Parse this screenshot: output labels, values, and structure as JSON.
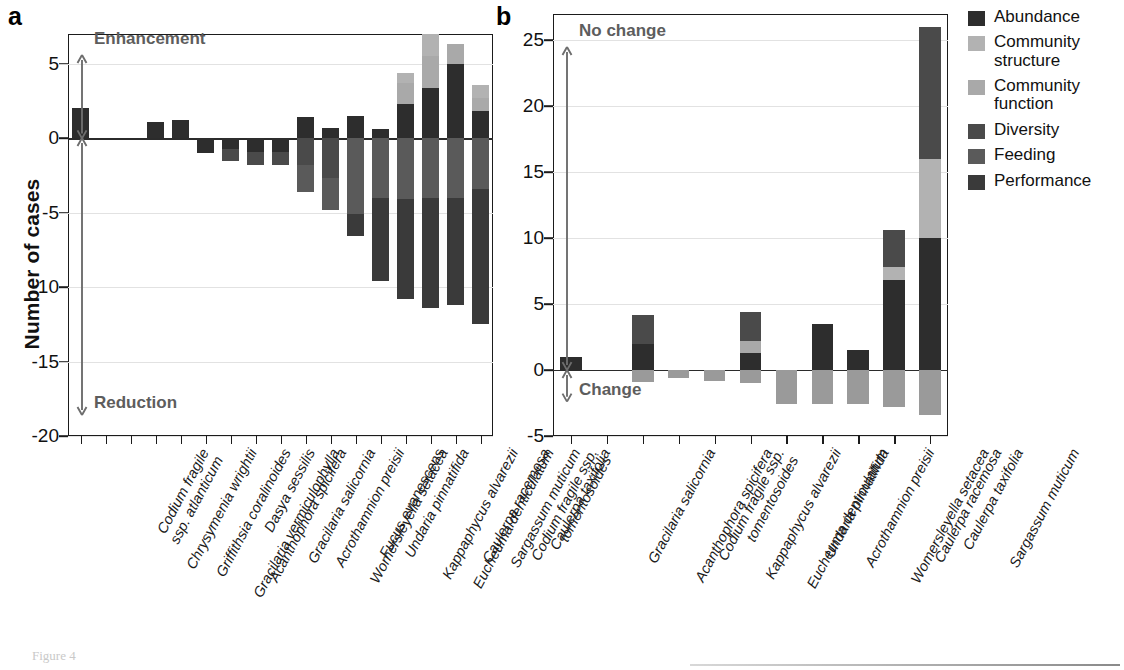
{
  "figure": {
    "caption": "Figure 4",
    "y_axis_title": "Number of cases",
    "panel_a_letter": "a",
    "panel_b_letter": "b"
  },
  "legend": {
    "position": "right",
    "items": [
      {
        "label": "Abundance",
        "color": "#2d2d2d"
      },
      {
        "label": "Community structure",
        "color": "#b2b2b2"
      },
      {
        "label": "Community function",
        "color": "#a9a9a9"
      },
      {
        "label": "Diversity",
        "color": "#4a4a4a"
      },
      {
        "label": "Feeding",
        "color": "#5a5a5a"
      },
      {
        "label": "Performance",
        "color": "#3a3a3a"
      }
    ]
  },
  "chart_data": [
    {
      "id": "panel-a",
      "type": "bar",
      "stacked": true,
      "title": "a",
      "xlabel": "",
      "ylabel": "Number of cases",
      "ylim": [
        -20,
        7
      ],
      "yticks": [
        5,
        0,
        -5,
        -10,
        -15,
        -20
      ],
      "ytick_labels": [
        "5",
        "0",
        "-5",
        "-10",
        "-15",
        "-20"
      ],
      "grid": true,
      "annotations": [
        {
          "text": "Enhancement",
          "range": [
            0,
            5.6
          ]
        },
        {
          "text": "Reduction",
          "range": [
            -18.6,
            0
          ]
        }
      ],
      "categories": [
        "Codium fragile ssp. atlanticum",
        "Chrysymenia wrightii",
        "Griffithsia coralinoides",
        "Gracilaria vermiculophylla",
        "Acanthophora spicifera",
        "Dasya sessilis",
        "Gracilaria salicornia",
        "Acrothamnion preisii",
        "Womersleyella setacea",
        "Fucus evanescens",
        "Undaria pinnatifida",
        "Kappaphycus alvarezii",
        "Eucheuma denticulatum",
        "Caulerpa racemosa",
        "Sargassum muticum",
        "Codium fragile ssp. tomentosoides",
        "Caulerpa taxifolia"
      ],
      "category_lines": [
        [
          "Codium fragile",
          "ssp. atlanticum"
        ],
        [
          "Chrysymenia wrightii"
        ],
        [
          "Griffithsia coralinoides"
        ],
        [
          "Gracilaria vermiculophylla"
        ],
        [
          "Acanthophora spicifera"
        ],
        [
          "Dasya sessilis"
        ],
        [
          "Gracilaria salicornia"
        ],
        [
          "Acrothamnion preisii"
        ],
        [
          "Womersleyella setacea"
        ],
        [
          "Fucus evanescens"
        ],
        [
          "Undaria pinnatifida"
        ],
        [
          "Kappaphycus alvarezii"
        ],
        [
          "Eucheuma denticulatum"
        ],
        [
          "Caulerpa racemosa"
        ],
        [
          "Sargassum muticum"
        ],
        [
          "Codium fragile ssp.",
          "tomentosoides"
        ],
        [
          "Caulerpa taxifolia"
        ]
      ],
      "series": [
        {
          "name": "Abundance",
          "color": "#2d2d2d",
          "values": [
            2.0,
            0,
            0,
            1.1,
            1.2,
            -1.0,
            -0.7,
            -0.9,
            -0.9,
            1.4,
            0.7,
            1.5,
            0.6,
            2.3,
            3.4,
            5.0,
            1.8
          ]
        },
        {
          "name": "Community structure",
          "color": "#b2b2b2",
          "values": [
            0,
            0,
            0,
            0,
            0,
            0,
            0,
            0,
            0,
            0,
            0,
            0,
            0,
            0.7,
            1.5,
            0,
            0.9
          ]
        },
        {
          "name": "Community function",
          "color": "#a9a9a9",
          "values": [
            0,
            0,
            0,
            0,
            0,
            0,
            0,
            0,
            0,
            0,
            0,
            0,
            0,
            1.4,
            2.1,
            1.3,
            0.9
          ]
        },
        {
          "name": "Diversity",
          "color": "#4a4a4a",
          "values": [
            0,
            0,
            0,
            0,
            0,
            0,
            -0.8,
            -0.9,
            -0.9,
            -1.8,
            -2.7,
            0,
            0,
            0,
            0,
            0,
            0
          ]
        },
        {
          "name": "Feeding",
          "color": "#5a5a5a",
          "values": [
            0,
            0,
            0,
            0,
            0,
            0,
            0,
            0,
            0,
            -1.8,
            -2.1,
            -5.1,
            -4.0,
            -4.1,
            -4.0,
            -4.0,
            -3.4
          ]
        },
        {
          "name": "Performance",
          "color": "#3a3a3a",
          "values": [
            0,
            0,
            0,
            0,
            0,
            0,
            0,
            0,
            0,
            0,
            0,
            -1.5,
            -5.6,
            -6.7,
            -7.4,
            -7.2,
            -9.1
          ]
        }
      ],
      "bars": [
        {
          "category": "Codium fragile ssp. atlanticum",
          "positive": [
            {
              "series": "Abundance",
              "value": 2.0
            }
          ],
          "negative": []
        },
        {
          "category": "Chrysymenia wrightii",
          "positive": [],
          "negative": []
        },
        {
          "category": "Griffithsia coralinoides",
          "positive": [],
          "negative": []
        },
        {
          "category": "Gracilaria vermiculophylla",
          "positive": [
            {
              "series": "Abundance",
              "value": 1.1
            }
          ],
          "negative": []
        },
        {
          "category": "Acanthophora spicifera",
          "positive": [
            {
              "series": "Abundance",
              "value": 1.2
            }
          ],
          "negative": []
        },
        {
          "category": "Dasya sessilis",
          "positive": [],
          "negative": [
            {
              "series": "Abundance",
              "value": -1.0
            }
          ]
        },
        {
          "category": "Gracilaria salicornia",
          "positive": [],
          "negative": [
            {
              "series": "Abundance",
              "value": -0.7
            },
            {
              "series": "Diversity",
              "value": -0.8
            }
          ]
        },
        {
          "category": "Acrothamnion preisii",
          "positive": [],
          "negative": [
            {
              "series": "Abundance",
              "value": -0.9
            },
            {
              "series": "Diversity",
              "value": -0.9
            }
          ]
        },
        {
          "category": "Womersleyella setacea",
          "positive": [],
          "negative": [
            {
              "series": "Abundance",
              "value": -0.9
            },
            {
              "series": "Diversity",
              "value": -0.9
            }
          ]
        },
        {
          "category": "Fucus evanescens",
          "positive": [
            {
              "series": "Abundance",
              "value": 1.4
            }
          ],
          "negative": [
            {
              "series": "Diversity",
              "value": -1.8
            },
            {
              "series": "Feeding",
              "value": -1.8
            }
          ]
        },
        {
          "category": "Undaria pinnatifida",
          "positive": [
            {
              "series": "Abundance",
              "value": 0.7
            }
          ],
          "negative": [
            {
              "series": "Diversity",
              "value": -2.7
            },
            {
              "series": "Feeding",
              "value": -2.1
            }
          ]
        },
        {
          "category": "Kappaphycus alvarezii",
          "positive": [
            {
              "series": "Abundance",
              "value": 1.5
            }
          ],
          "negative": [
            {
              "series": "Feeding",
              "value": -5.1
            },
            {
              "series": "Performance",
              "value": -1.5
            }
          ]
        },
        {
          "category": "Eucheuma denticulatum",
          "positive": [
            {
              "series": "Abundance",
              "value": 0.6
            }
          ],
          "negative": [
            {
              "series": "Feeding",
              "value": -4.0
            },
            {
              "series": "Performance",
              "value": -5.6
            }
          ]
        },
        {
          "category": "Caulerpa racemosa",
          "positive": [
            {
              "series": "Abundance",
              "value": 2.3
            },
            {
              "series": "Community function",
              "value": 1.4
            },
            {
              "series": "Community structure",
              "value": 0.7
            }
          ],
          "negative": [
            {
              "series": "Feeding",
              "value": -4.1
            },
            {
              "series": "Performance",
              "value": -6.7
            }
          ]
        },
        {
          "category": "Sargassum muticum",
          "positive": [
            {
              "series": "Abundance",
              "value": 3.4
            },
            {
              "series": "Community function",
              "value": 2.1
            },
            {
              "series": "Community structure",
              "value": 1.5
            }
          ],
          "negative": [
            {
              "series": "Feeding",
              "value": -4.0
            },
            {
              "series": "Performance",
              "value": -7.4
            }
          ]
        },
        {
          "category": "Codium fragile ssp. tomentosoides",
          "positive": [
            {
              "series": "Abundance",
              "value": 5.0
            },
            {
              "series": "Community function",
              "value": 1.3
            }
          ],
          "negative": [
            {
              "series": "Feeding",
              "value": -4.0
            },
            {
              "series": "Performance",
              "value": -7.2
            }
          ]
        },
        {
          "category": "Caulerpa taxifolia",
          "positive": [
            {
              "series": "Abundance",
              "value": 1.8
            },
            {
              "series": "Community function",
              "value": 0.9
            },
            {
              "series": "Community structure",
              "value": 0.9
            }
          ],
          "negative": [
            {
              "series": "Feeding",
              "value": -3.4
            },
            {
              "series": "Performance",
              "value": -9.1
            }
          ]
        }
      ]
    },
    {
      "id": "panel-b",
      "type": "bar",
      "stacked": true,
      "title": "b",
      "xlabel": "",
      "ylabel": "Number of cases",
      "ylim": [
        -5,
        27
      ],
      "yticks": [
        25,
        20,
        15,
        10,
        5,
        0,
        -5
      ],
      "ytick_labels": [
        "25",
        "20",
        "15",
        "10",
        "5",
        "0",
        "-5"
      ],
      "grid": true,
      "annotations": [
        {
          "text": "No change",
          "range": [
            0,
            24.5
          ]
        },
        {
          "text": "Change",
          "range": [
            -2.4,
            0
          ]
        }
      ],
      "categories": [
        "Gracilaria salicornia",
        "Acanthophora spicifera",
        "Codium fragile ssp. tomentosoides",
        "Kappaphycus alvarezii",
        "Eucheuma denticulatum",
        "Undaria pinnatifida",
        "Acrothamnion preisii",
        "Womersleyella setacea",
        "Caulerpa racemosa",
        "Caulerpa taxifolia",
        "Sargassum muticum"
      ],
      "category_lines": [
        [
          "Gracilaria salicornia"
        ],
        [
          "Acanthophora spicifera"
        ],
        [
          "Codium fragile ssp.",
          "tomentosoides"
        ],
        [
          "Kappaphycus alvarezii"
        ],
        [
          "Eucheuma denticulatum"
        ],
        [
          "Undaria pinnatifida"
        ],
        [
          "Acrothamnion preisii"
        ],
        [
          "Womersleyella setacea"
        ],
        [
          "Caulerpa racemosa"
        ],
        [
          "Caulerpa taxifolia"
        ],
        [
          "Sargassum muticum"
        ]
      ],
      "series": [
        {
          "name": "Abundance",
          "color": "#2d2d2d",
          "values": [
            1.0,
            0,
            2.0,
            0,
            0,
            1.3,
            0,
            3.5,
            1.5,
            6.8,
            10.0
          ]
        },
        {
          "name": "Community structure",
          "color": "#b2b2b2",
          "values": [
            0,
            0,
            0,
            0,
            0,
            0,
            0,
            0,
            0,
            1.0,
            6.0
          ]
        },
        {
          "name": "Community function",
          "color": "#a9a9a9",
          "values": [
            0,
            0,
            0,
            0,
            0,
            0.9,
            0,
            0,
            0,
            0,
            0
          ]
        },
        {
          "name": "Diversity",
          "color": "#4a4a4a",
          "values": [
            0,
            0,
            2.2,
            0,
            0,
            2.2,
            0,
            0,
            0,
            2.8,
            10.0
          ]
        },
        {
          "name": "Feeding",
          "color": "#9a9a9a",
          "values": [
            0,
            0,
            -0.9,
            -0.6,
            -0.8,
            -1.0,
            -2.6,
            -2.6,
            -2.6,
            -2.8,
            -3.4
          ]
        }
      ],
      "bars": [
        {
          "category": "Gracilaria salicornia",
          "positive": [
            {
              "series": "Abundance",
              "value": 1.0
            }
          ],
          "negative": []
        },
        {
          "category": "Acanthophora spicifera",
          "positive": [],
          "negative": []
        },
        {
          "category": "Codium fragile ssp. tomentosoides",
          "positive": [
            {
              "series": "Abundance",
              "value": 2.0
            },
            {
              "series": "Diversity",
              "value": 2.2
            }
          ],
          "negative": [
            {
              "series": "Feeding",
              "value": -0.9
            }
          ]
        },
        {
          "category": "Kappaphycus alvarezii",
          "positive": [],
          "negative": [
            {
              "series": "Feeding",
              "value": -0.6
            }
          ]
        },
        {
          "category": "Eucheuma denticulatum",
          "positive": [],
          "negative": [
            {
              "series": "Feeding",
              "value": -0.8
            }
          ]
        },
        {
          "category": "Undaria pinnatifida",
          "positive": [
            {
              "series": "Abundance",
              "value": 1.3
            },
            {
              "series": "Community function",
              "value": 0.9
            },
            {
              "series": "Diversity",
              "value": 2.2
            }
          ],
          "negative": [
            {
              "series": "Feeding",
              "value": -1.0
            }
          ]
        },
        {
          "category": "Acrothamnion preisii",
          "positive": [],
          "negative": [
            {
              "series": "Feeding",
              "value": -2.6
            }
          ]
        },
        {
          "category": "Womersleyella setacea",
          "positive": [
            {
              "series": "Abundance",
              "value": 3.5
            }
          ],
          "negative": [
            {
              "series": "Feeding",
              "value": -2.6
            }
          ]
        },
        {
          "category": "Caulerpa racemosa",
          "positive": [
            {
              "series": "Abundance",
              "value": 1.5
            }
          ],
          "negative": [
            {
              "series": "Feeding",
              "value": -2.6
            }
          ]
        },
        {
          "category": "Caulerpa taxifolia",
          "positive": [
            {
              "series": "Abundance",
              "value": 6.8
            },
            {
              "series": "Community structure",
              "value": 1.0
            },
            {
              "series": "Diversity",
              "value": 2.8
            }
          ],
          "negative": [
            {
              "series": "Feeding",
              "value": -2.8
            }
          ]
        },
        {
          "category": "Sargassum muticum",
          "positive": [
            {
              "series": "Abundance",
              "value": 10.0
            },
            {
              "series": "Community structure",
              "value": 6.0
            },
            {
              "series": "Diversity",
              "value": 10.0
            }
          ],
          "negative": [
            {
              "series": "Feeding",
              "value": -3.4
            }
          ]
        }
      ]
    }
  ]
}
